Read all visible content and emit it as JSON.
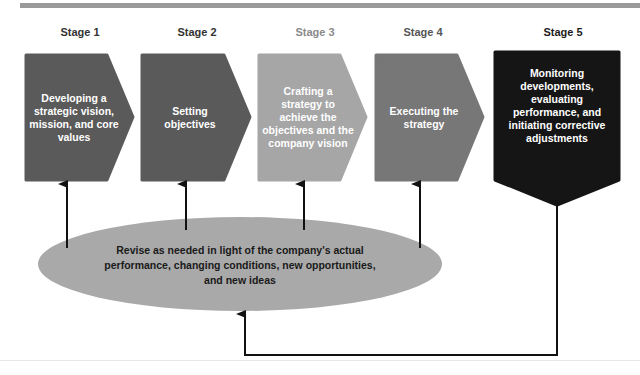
{
  "diagram": {
    "stages": [
      {
        "label": "Stage 1",
        "text": "Developing a strategic vision, mission, and core values",
        "color": "#5a5a5a",
        "label_color": "#333333"
      },
      {
        "label": "Stage 2",
        "text": "Setting objectives",
        "color": "#5a5a5a",
        "label_color": "#333333"
      },
      {
        "label": "Stage 3",
        "text": "Crafting a strategy to achieve the objectives and the company vision",
        "color": "#a6a6a6",
        "label_color": "#8a8a8a"
      },
      {
        "label": "Stage 4",
        "text": "Executing the strategy",
        "color": "#777777",
        "label_color": "#555555"
      },
      {
        "label": "Stage 5",
        "text": "Monitoring developments, evaluating performance, and initiating corrective adjustments",
        "color": "#151515",
        "label_color": "#1a1a1a"
      }
    ],
    "feedback": {
      "text": "Revise as needed in light of the company's actual performance, changing conditions, new opportunities, and new ideas",
      "color": "#a9a9a9"
    }
  }
}
